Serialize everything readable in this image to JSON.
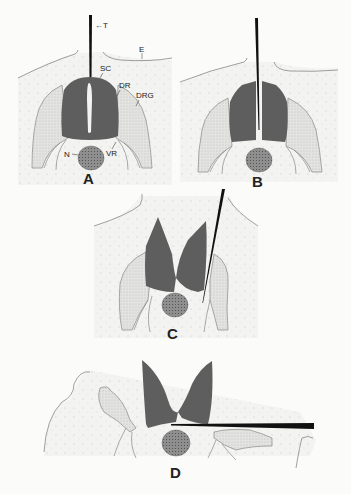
{
  "figure": {
    "colors": {
      "background": "#fbfbfa",
      "field": "#f1f1ef",
      "cord": "#5e5e5e",
      "ganglion": "#e4e4e1",
      "notochord": "#8a8a8a",
      "instrument": "#111111",
      "outline": "#888888"
    },
    "panels": [
      {
        "id": "A",
        "label": "A",
        "annotations": [
          {
            "key": "T",
            "text": "←T",
            "meaning": "instrument"
          },
          {
            "key": "E",
            "text": "E"
          },
          {
            "key": "SC",
            "text": "SC"
          },
          {
            "key": "DR",
            "text": "DR"
          },
          {
            "key": "DRG",
            "text": "DRG"
          },
          {
            "key": "VR",
            "text": "VR"
          },
          {
            "key": "N",
            "text": "N"
          }
        ]
      },
      {
        "id": "B",
        "label": "B"
      },
      {
        "id": "C",
        "label": "C"
      },
      {
        "id": "D",
        "label": "D"
      }
    ]
  }
}
